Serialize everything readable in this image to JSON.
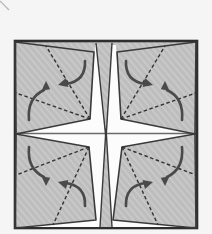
{
  "figure": {
    "width": 212,
    "height": 234
  },
  "colors": {
    "page_bg": "#f5f5f5",
    "paper_gray": "#bdbdbd",
    "paper_stripe": "#cbcbcb",
    "outline_dark": "#3a3a3a",
    "border_dark": "#2e2e2e",
    "gap_white": "#fcfcfc",
    "crease_gray": "#6a6a6a",
    "fold_dash": "#333333",
    "arrow_gray": "#4a4a4a",
    "corner_mark": "#b5b5b5"
  },
  "diagram": {
    "elements": [
      {
        "tag": "line",
        "name": "page-corner-mark",
        "attrs": {
          "x1": "0",
          "y1": "1",
          "x2": "9",
          "y2": "10",
          "stroke": "#b5b5b5",
          "stroke-width": "1.2"
        }
      },
      {
        "tag": "rect",
        "name": "paper-square",
        "attrs": {
          "x": "15",
          "y": "41",
          "width": "182",
          "height": "187",
          "fill": "url(#tex)",
          "stroke": "#2e2e2e",
          "stroke-width": "2.6"
        }
      },
      {
        "tag": "polygon",
        "name": "star-gap",
        "attrs": {
          "points": "16,134 90,119 95,45 116,45 121,119 195,134 122,147 113,220 196,227 15,227 96,220 89,147",
          "fill": "#fcfcfc",
          "stroke": "none"
        }
      },
      {
        "tag": "line",
        "name": "center-crease-line",
        "attrs": {
          "x1": "16",
          "y1": "133.5",
          "x2": "196",
          "y2": "133.5",
          "stroke": "#6a6a6a",
          "stroke-width": "1.4"
        }
      },
      {
        "tag": "path",
        "name": "back-wedge-top",
        "attrs": {
          "d": "M96,43 L106,139 L112,43",
          "fill": "url(#tex)",
          "stroke": "#3a3a3a",
          "stroke-width": "1.4",
          "stroke-linejoin": "miter"
        }
      },
      {
        "tag": "path",
        "name": "back-wedge-bottom",
        "attrs": {
          "d": "M100,227 L106,128 L112,227",
          "fill": "url(#tex)",
          "stroke": "#3a3a3a",
          "stroke-width": "1.4",
          "stroke-linejoin": "miter"
        }
      },
      {
        "tag": "polygon",
        "name": "flap-top-left",
        "attrs": {
          "points": "15,42 94,52 90,119 16,134",
          "fill": "none",
          "stroke": "#3a3a3a",
          "stroke-width": "1.6",
          "stroke-linejoin": "round"
        }
      },
      {
        "tag": "polygon",
        "name": "flap-top-right",
        "attrs": {
          "points": "196,42 117,52 121,119 195,134",
          "fill": "none",
          "stroke": "#3a3a3a",
          "stroke-width": "1.6",
          "stroke-linejoin": "round"
        }
      },
      {
        "tag": "polygon",
        "name": "flap-bottom-left",
        "attrs": {
          "points": "16,134 89,147 96,220 15,228",
          "fill": "none",
          "stroke": "#3a3a3a",
          "stroke-width": "1.6",
          "stroke-linejoin": "round"
        }
      },
      {
        "tag": "polygon",
        "name": "flap-bottom-right",
        "attrs": {
          "points": "195,134 122,147 113,220 196,228",
          "fill": "none",
          "stroke": "#3a3a3a",
          "stroke-width": "1.6",
          "stroke-linejoin": "round"
        }
      },
      {
        "tag": "line",
        "name": "valley-fold-line-tl-upper",
        "attrs": {
          "x1": "90",
          "y1": "119",
          "x2": "46",
          "y2": "46",
          "stroke": "#333333",
          "stroke-width": "1.4",
          "stroke-dasharray": "3.5 2.5"
        }
      },
      {
        "tag": "line",
        "name": "valley-fold-line-tl-lower",
        "attrs": {
          "x1": "90",
          "y1": "119",
          "x2": "16",
          "y2": "93",
          "stroke": "#333333",
          "stroke-width": "1.4",
          "stroke-dasharray": "3.5 2.5"
        }
      },
      {
        "tag": "line",
        "name": "valley-fold-line-tr-upper",
        "attrs": {
          "x1": "121",
          "y1": "119",
          "x2": "165",
          "y2": "46",
          "stroke": "#333333",
          "stroke-width": "1.4",
          "stroke-dasharray": "3.5 2.5"
        }
      },
      {
        "tag": "line",
        "name": "valley-fold-line-tr-lower",
        "attrs": {
          "x1": "121",
          "y1": "119",
          "x2": "196",
          "y2": "93",
          "stroke": "#333333",
          "stroke-width": "1.4",
          "stroke-dasharray": "3.5 2.5"
        }
      },
      {
        "tag": "line",
        "name": "valley-fold-line-bl-upper",
        "attrs": {
          "x1": "89",
          "y1": "147",
          "x2": "16",
          "y2": "175",
          "stroke": "#333333",
          "stroke-width": "1.4",
          "stroke-dasharray": "3.5 2.5"
        }
      },
      {
        "tag": "line",
        "name": "valley-fold-line-bl-lower",
        "attrs": {
          "x1": "89",
          "y1": "147",
          "x2": "53",
          "y2": "225",
          "stroke": "#333333",
          "stroke-width": "1.4",
          "stroke-dasharray": "3.5 2.5"
        }
      },
      {
        "tag": "line",
        "name": "valley-fold-line-br-upper",
        "attrs": {
          "x1": "122",
          "y1": "147",
          "x2": "196",
          "y2": "175",
          "stroke": "#333333",
          "stroke-width": "1.4",
          "stroke-dasharray": "3.5 2.5"
        }
      },
      {
        "tag": "line",
        "name": "valley-fold-line-br-lower",
        "attrs": {
          "x1": "122",
          "y1": "147",
          "x2": "158",
          "y2": "225",
          "stroke": "#333333",
          "stroke-width": "1.4",
          "stroke-dasharray": "3.5 2.5"
        }
      },
      {
        "tag": "path",
        "name": "fold-arrow-tl-up",
        "attrs": {
          "d": "M29,120 Q27,98 44,90",
          "fill": "none",
          "stroke": "#4a4a4a",
          "stroke-width": "2.6",
          "stroke-linecap": "round"
        }
      },
      {
        "tag": "polygon",
        "name": "fold-arrowhead-tl-up",
        "attrs": {
          "points": "46,81 41.6,90.4 50.2,89.2",
          "fill": "#4a4a4a"
        }
      },
      {
        "tag": "path",
        "name": "fold-arrow-tl-down-left",
        "attrs": {
          "d": "M85,61 Q86,81 66,84",
          "fill": "none",
          "stroke": "#4a4a4a",
          "stroke-width": "2.6",
          "stroke-linecap": "round"
        }
      },
      {
        "tag": "polygon",
        "name": "fold-arrowhead-tl-down-left",
        "attrs": {
          "points": "58,85 68.4,87 66,78",
          "fill": "#4a4a4a"
        }
      },
      {
        "tag": "path",
        "name": "fold-arrow-tr-up",
        "attrs": {
          "d": "M182,120 Q184,98 167,90",
          "fill": "none",
          "stroke": "#4a4a4a",
          "stroke-width": "2.6",
          "stroke-linecap": "round"
        }
      },
      {
        "tag": "polygon",
        "name": "fold-arrowhead-tr-up",
        "attrs": {
          "points": "165,81 169.4,90.4 160.8,89.2",
          "fill": "#4a4a4a"
        }
      },
      {
        "tag": "path",
        "name": "fold-arrow-tr-down-right",
        "attrs": {
          "d": "M126,61 Q125,81 145,84",
          "fill": "none",
          "stroke": "#4a4a4a",
          "stroke-width": "2.6",
          "stroke-linecap": "round"
        }
      },
      {
        "tag": "polygon",
        "name": "fold-arrowhead-tr-down-right",
        "attrs": {
          "points": "153,85 142.6,87 145,78",
          "fill": "#4a4a4a"
        }
      },
      {
        "tag": "path",
        "name": "fold-arrow-bl-down",
        "attrs": {
          "d": "M29,147 Q27,169 44,177",
          "fill": "none",
          "stroke": "#4a4a4a",
          "stroke-width": "2.6",
          "stroke-linecap": "round"
        }
      },
      {
        "tag": "polygon",
        "name": "fold-arrowhead-bl-down",
        "attrs": {
          "points": "46,186 41.6,176.6 50.2,177.8",
          "fill": "#4a4a4a"
        }
      },
      {
        "tag": "path",
        "name": "fold-arrow-bl-up-left",
        "attrs": {
          "d": "M85,206 Q86,186 66,183",
          "fill": "none",
          "stroke": "#4a4a4a",
          "stroke-width": "2.6",
          "stroke-linecap": "round"
        }
      },
      {
        "tag": "polygon",
        "name": "fold-arrowhead-bl-up-left",
        "attrs": {
          "points": "58,182 68.4,180 66,189",
          "fill": "#4a4a4a"
        }
      },
      {
        "tag": "path",
        "name": "fold-arrow-br-down",
        "attrs": {
          "d": "M182,147 Q184,169 167,177",
          "fill": "none",
          "stroke": "#4a4a4a",
          "stroke-width": "2.6",
          "stroke-linecap": "round"
        }
      },
      {
        "tag": "polygon",
        "name": "fold-arrowhead-br-down",
        "attrs": {
          "points": "165,186 169.4,176.6 160.8,177.8",
          "fill": "#4a4a4a"
        }
      },
      {
        "tag": "path",
        "name": "fold-arrow-br-up-right",
        "attrs": {
          "d": "M126,206 Q125,186 145,183",
          "fill": "none",
          "stroke": "#4a4a4a",
          "stroke-width": "2.6",
          "stroke-linecap": "round"
        }
      },
      {
        "tag": "polygon",
        "name": "fold-arrowhead-br-up-right",
        "attrs": {
          "points": "153,182 142.6,180 145,189",
          "fill": "#4a4a4a"
        }
      }
    ]
  }
}
